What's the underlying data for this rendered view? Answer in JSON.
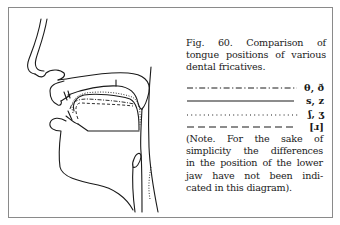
{
  "figure": {
    "number": "Fig. 60.",
    "caption_lines": [
      "Fig. 60.  Comparison of",
      "tongue positions of various",
      "dental  fricatives."
    ],
    "diagram_icon": "sagittal-vocal-tract-diagram"
  },
  "legend": [
    {
      "line_style": "dash-dot",
      "symbol": "θ, ð"
    },
    {
      "line_style": "solid",
      "symbol": "s, z"
    },
    {
      "line_style": "dotted",
      "symbol": "ʃ, ʒ"
    },
    {
      "line_style": "dashed",
      "symbol": "[ɹ]"
    }
  ],
  "note": {
    "lines": [
      "(Note.  For the sake of",
      "simplicity the differences",
      "in the position of the lower",
      "jaw have not been indi-",
      "cated in this diagram)."
    ]
  },
  "colors": {
    "ink": "#1a1a1a",
    "frame": "#8a8a8a",
    "background": "#ffffff"
  }
}
